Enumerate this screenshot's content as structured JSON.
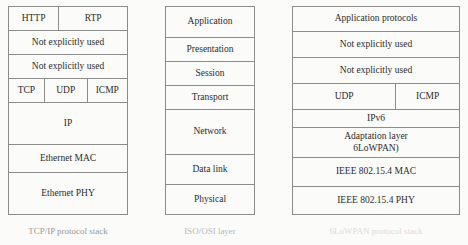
{
  "figure": {
    "columns": [
      {
        "id": "tcpip",
        "caption": "TCP/IP protocol stack",
        "rows": [
          {
            "type": "split",
            "cells": [
              {
                "label": "HTTP",
                "flex": 42
              },
              {
                "label": "RTP",
                "flex": 58
              }
            ],
            "height": 24
          },
          {
            "type": "single",
            "label": "Not explicitly used",
            "height": 24
          },
          {
            "type": "single",
            "label": "Not explicitly used",
            "height": 24
          },
          {
            "type": "split",
            "cells": [
              {
                "label": "TCP",
                "flex": 30
              },
              {
                "label": "UDP",
                "flex": 36
              },
              {
                "label": "ICMP",
                "flex": 34
              }
            ],
            "height": 24
          },
          {
            "type": "single",
            "label": "IP",
            "height": 42
          },
          {
            "type": "single",
            "label": "Ethernet MAC",
            "height": 28
          },
          {
            "type": "single",
            "label": "Ethernet PHY",
            "height": 43
          }
        ]
      },
      {
        "id": "osi",
        "caption": "ISO/OSI layer",
        "rows": [
          {
            "type": "single",
            "label": "Application",
            "height": 31
          },
          {
            "type": "single",
            "label": "Presentation",
            "height": 24
          },
          {
            "type": "single",
            "label": "Session",
            "height": 24
          },
          {
            "type": "single",
            "label": "Transport",
            "height": 24
          },
          {
            "type": "single",
            "label": "Network",
            "height": 45
          },
          {
            "type": "single",
            "label": "Data link",
            "height": 30
          },
          {
            "type": "single",
            "label": "Physical",
            "height": 31
          }
        ]
      },
      {
        "id": "lowpan",
        "caption": "6LoWPAN protocol stack",
        "rows": [
          {
            "type": "single",
            "label": "Application protocols",
            "height": 25
          },
          {
            "type": "single",
            "label": "Not explicitly used",
            "height": 26
          },
          {
            "type": "single",
            "label": "Not explicitly used",
            "height": 26
          },
          {
            "type": "split",
            "cells": [
              {
                "label": "UDP",
                "flex": 62
              },
              {
                "label": "ICMP",
                "flex": 38
              }
            ],
            "height": 26
          },
          {
            "type": "single",
            "label": "IPv6",
            "height": 18
          },
          {
            "type": "two-line",
            "line1": "Adaptation layer",
            "line2": "6LoWPAN)",
            "height": 30
          },
          {
            "type": "single",
            "label": "IEEE 802.15.4 MAC",
            "height": 29
          },
          {
            "type": "single",
            "label": "IEEE 802.15.4 PHY",
            "height": 29
          }
        ]
      }
    ]
  },
  "style": {
    "border_color": "#8c8c8c",
    "text_color": "#2c2c2c",
    "background": "#fbfbf9",
    "caption_colors": [
      "#9a9a9a",
      "#b9b9b9",
      "#dcdcdc"
    ]
  }
}
